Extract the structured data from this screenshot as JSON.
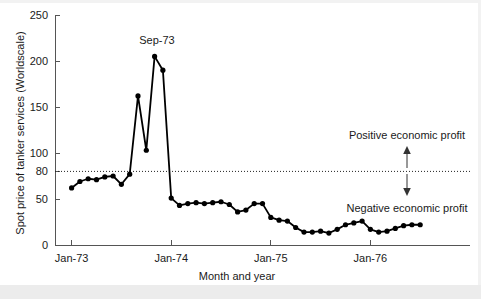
{
  "chart_data": {
    "type": "line",
    "title": "",
    "xlabel": "Month and year",
    "ylabel": "Spot price of tanker services (Worldscale)",
    "ylim": [
      0,
      250
    ],
    "yticks": [
      0,
      50,
      80,
      100,
      150,
      200,
      250
    ],
    "ytick_labels": [
      "0",
      "50",
      "80",
      "100",
      "150",
      "200",
      "250"
    ],
    "xlim": [
      0,
      50
    ],
    "xticks": [
      2,
      14,
      26,
      38
    ],
    "xtick_labels": [
      "Jan-73",
      "Jan-74",
      "Jan-75",
      "Jan-76"
    ],
    "grid": false,
    "legend": "none",
    "threshold": {
      "value": 80,
      "style": "dotted",
      "above_label": "Positive economic profit",
      "below_label": "Negative economic profit"
    },
    "annotations": [
      {
        "text": "Sep-73",
        "x": 10,
        "y": 205,
        "note": "peak label"
      }
    ],
    "series": [
      {
        "name": "Spot price of tanker services",
        "x": [
          2,
          3,
          4,
          5,
          6,
          7,
          8,
          9,
          10,
          11,
          12,
          13,
          14,
          15,
          16,
          17,
          18,
          19,
          20,
          21,
          22,
          23,
          24,
          25,
          26,
          27,
          28,
          29,
          30,
          31,
          32,
          33,
          34,
          35,
          36,
          37,
          38,
          39,
          40,
          41,
          42,
          43,
          44
        ],
        "values": [
          62,
          69,
          72,
          71,
          74,
          75,
          66,
          77,
          162,
          103,
          205,
          190,
          51,
          43,
          45,
          46,
          45,
          46,
          47,
          44,
          36,
          38,
          45,
          45,
          30,
          27,
          26,
          19,
          14,
          14,
          15,
          13,
          17,
          22,
          24,
          26,
          17,
          14,
          15,
          18,
          21,
          22,
          22
        ]
      }
    ]
  },
  "axis": {
    "ylabel": "Spot price of tanker services (Worldscale)",
    "xlabel": "Month and year"
  },
  "labels": {
    "peak": "Sep-73",
    "positive": "Positive economic profit",
    "negative": "Negative economic profit"
  }
}
